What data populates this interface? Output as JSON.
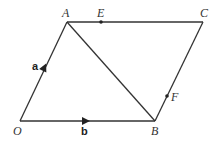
{
  "diagram": {
    "type": "parallelogram-vectors",
    "points": {
      "O": {
        "label": "O",
        "x": 20,
        "y": 121
      },
      "A": {
        "label": "A",
        "x": 67,
        "y": 22
      },
      "B": {
        "label": "B",
        "x": 155,
        "y": 121
      },
      "C": {
        "label": "C",
        "x": 203,
        "y": 22
      },
      "E": {
        "label": "E",
        "x": 101,
        "y": 22
      },
      "F": {
        "label": "F",
        "x": 167,
        "y": 96
      }
    },
    "vectors": {
      "a": {
        "label": "a",
        "from": "O",
        "to": "A"
      },
      "b": {
        "label": "b",
        "from": "O",
        "to": "B"
      }
    },
    "segments": [
      "OA",
      "OB",
      "AC",
      "BC",
      "AB"
    ],
    "colors": {
      "line": "#333333",
      "background": "#ffffff"
    }
  }
}
